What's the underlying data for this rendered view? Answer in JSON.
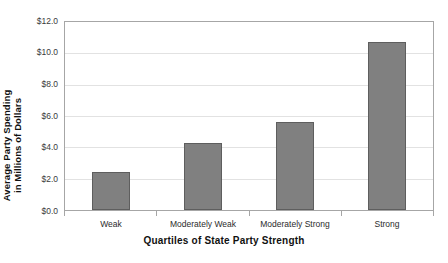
{
  "chart_data": {
    "type": "bar",
    "title": "",
    "xlabel": "Quartiles of State Party Strength",
    "ylabel": "Average Party Spending in Millions of Dollars",
    "ylabel_lines": [
      "Average Party Spending",
      "in Millions of Dollars"
    ],
    "categories": [
      "Weak",
      "Moderately Weak",
      "Moderately Strong",
      "Strong"
    ],
    "values": [
      2.4,
      4.3,
      5.6,
      10.7
    ],
    "ylim": [
      0.0,
      12.0
    ],
    "ytick_values": [
      0.0,
      2.0,
      4.0,
      6.0,
      8.0,
      10.0,
      12.0
    ],
    "ytick_labels": [
      "$0.0",
      "$2.0",
      "$4.0",
      "$6.0",
      "$8.0",
      "$10.0",
      "$12.0"
    ],
    "grid": true,
    "grid_axis": "y",
    "legend": false,
    "legend_position": "none",
    "bar_color": "#808080",
    "bar_edge_color": "#5e5e5e",
    "gridline_color": "#e2e2e2",
    "frame_color": "#a6a6a6",
    "background_color": "#ffffff"
  }
}
